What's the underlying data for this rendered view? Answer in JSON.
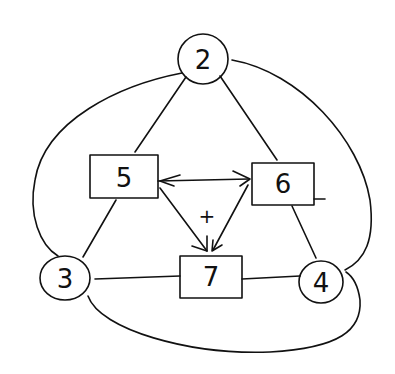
{
  "diagram": {
    "type": "signal-flow-graph",
    "nodes": [
      {
        "id": "2",
        "label": "2",
        "shape": "circle",
        "x": 203,
        "y": 59,
        "r": 25
      },
      {
        "id": "3",
        "label": "3",
        "shape": "circle",
        "x": 65,
        "y": 278,
        "r": 24
      },
      {
        "id": "4",
        "label": "4",
        "shape": "circle",
        "x": 321,
        "y": 282,
        "r": 23
      },
      {
        "id": "5",
        "label": "5",
        "shape": "box",
        "x": 90,
        "y": 155,
        "w": 68,
        "h": 43
      },
      {
        "id": "6",
        "label": "6",
        "shape": "box",
        "x": 252,
        "y": 163,
        "w": 62,
        "h": 42
      },
      {
        "id": "7",
        "label": "7",
        "shape": "box",
        "x": 180,
        "y": 256,
        "w": 62,
        "h": 42
      }
    ],
    "edges": [
      {
        "from": "2",
        "to": "5",
        "directed": false
      },
      {
        "from": "2",
        "to": "6",
        "directed": false
      },
      {
        "from": "2",
        "to": "3",
        "directed": false,
        "curved": true
      },
      {
        "from": "2",
        "to": "4",
        "directed": false,
        "curved": true
      },
      {
        "from": "5",
        "to": "3",
        "directed": false
      },
      {
        "from": "6",
        "to": "4",
        "directed": false
      },
      {
        "from": "3",
        "to": "7",
        "directed": false
      },
      {
        "from": "7",
        "to": "4",
        "directed": false
      },
      {
        "from": "3",
        "to": "4",
        "directed": false,
        "curved": true
      },
      {
        "from": "6",
        "to": "5",
        "directed": true
      },
      {
        "from": "5",
        "to": "6",
        "directed": true
      },
      {
        "from": "5",
        "to": "7",
        "directed": true
      },
      {
        "from": "6",
        "to": "7",
        "directed": true
      }
    ],
    "annotations": [
      {
        "text": "+",
        "x": 207,
        "y": 217
      }
    ]
  },
  "labels": {
    "n2": "2",
    "n3": "3",
    "n4": "4",
    "n5": "5",
    "n6": "6",
    "n7": "7",
    "sign": "+"
  }
}
